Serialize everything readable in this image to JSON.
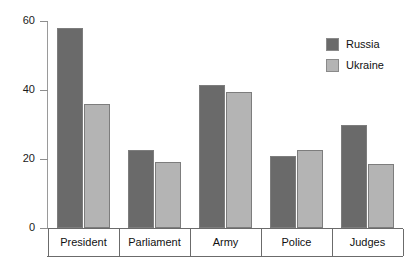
{
  "chart_data": {
    "type": "bar",
    "title": "",
    "subtitle": "",
    "xlabel": "",
    "ylabel": "",
    "categories": [
      "President",
      "Parliament",
      "Army",
      "Police",
      "Judges"
    ],
    "series": [
      {
        "name": "Russia",
        "color": "#6a6a6a",
        "values": [
          58,
          22.5,
          41.5,
          21,
          30
        ]
      },
      {
        "name": "Ukraine",
        "color": "#b4b4b4",
        "values": [
          36,
          19,
          39.5,
          22.5,
          18.5
        ]
      }
    ],
    "ylim": [
      0,
      62
    ],
    "yticks": [
      0,
      20,
      40,
      60
    ],
    "ytick_labels": [
      "0",
      "20",
      "40",
      "60"
    ],
    "grid": false,
    "legend_position": "top-right",
    "annotations": []
  },
  "legend": {
    "items": [
      {
        "label": "Russia",
        "color": "#6a6a6a"
      },
      {
        "label": "Ukraine",
        "color": "#b4b4b4"
      }
    ]
  },
  "axis": {
    "y_tick_labels": [
      "60",
      "40",
      "20",
      "0"
    ],
    "x_category_labels": [
      "President",
      "Parliament",
      "Army",
      "Police",
      "Judges"
    ]
  }
}
